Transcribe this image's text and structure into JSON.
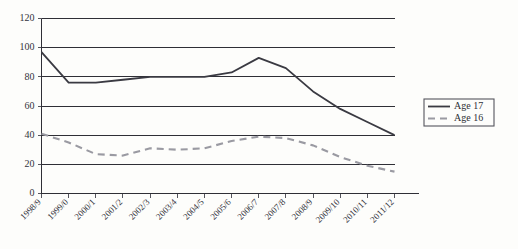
{
  "chart_data": {
    "type": "line",
    "title": "",
    "xlabel": "",
    "ylabel": "",
    "ylim": [
      0,
      120
    ],
    "ytick_step": 20,
    "yticks": [
      "0",
      "20",
      "40",
      "60",
      "80",
      "100",
      "120"
    ],
    "grid": true,
    "legend_position": "right",
    "categories": [
      "1998/9",
      "1999/0",
      "2000/1",
      "2001/2",
      "2002/3",
      "2003/4",
      "2004/5",
      "2005/6",
      "2006/7",
      "2007/8",
      "2008/9",
      "2009/10",
      "2010/11",
      "2011/12"
    ],
    "series": [
      {
        "name": "Age 17",
        "style": "solid",
        "color": "#3a3a42",
        "values": [
          97,
          76,
          76,
          78,
          80,
          80,
          80,
          83,
          93,
          86,
          70,
          58,
          49,
          40
        ]
      },
      {
        "name": "Age 16",
        "style": "dashed",
        "color": "#9a9aa2",
        "values": [
          41,
          35,
          27,
          26,
          31,
          30,
          31,
          36,
          39,
          38,
          33,
          25,
          19,
          15
        ]
      }
    ]
  },
  "legend": {
    "entries": [
      {
        "label": "Age 17"
      },
      {
        "label": "Age 16"
      }
    ]
  },
  "colors": {
    "background": "#fdfdfb",
    "axis": "#2f2f36",
    "series_age17": "#3a3a42",
    "series_age16": "#9a9aa2"
  }
}
